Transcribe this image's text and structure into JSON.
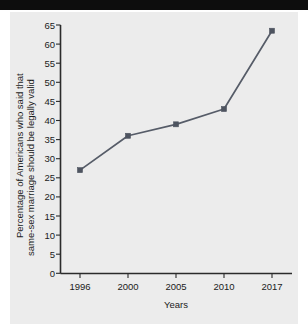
{
  "figure": {
    "background_color": "#ececec",
    "page_color": "#ffffff",
    "top_bar_color": "#0d0d0d"
  },
  "chart_data": {
    "type": "line",
    "title": "",
    "xlabel": "Years",
    "ylabel_line1": "Percentage of Americans who said that",
    "ylabel_line2": "same-sex marriage should be legally valid",
    "categories": [
      "1996",
      "2000",
      "2005",
      "2010",
      "2017"
    ],
    "x": [
      1996,
      2000,
      2005,
      2010,
      2017
    ],
    "values": [
      27,
      36,
      39,
      43,
      63.5
    ],
    "ylim": [
      0,
      65
    ],
    "yticks": [
      0,
      5,
      10,
      15,
      20,
      25,
      30,
      35,
      40,
      45,
      50,
      55,
      60,
      65
    ],
    "ytick_labels": [
      "0",
      "5",
      "10",
      "15",
      "20",
      "25",
      "30",
      "35",
      "40",
      "45",
      "50",
      "55",
      "60",
      "65"
    ],
    "xtick_labels": [
      "1996",
      "2000",
      "2005",
      "2010",
      "2017"
    ],
    "grid": false,
    "legend": false,
    "series_color": "#565c68",
    "marker": "square",
    "marker_color": "#4e5460"
  }
}
